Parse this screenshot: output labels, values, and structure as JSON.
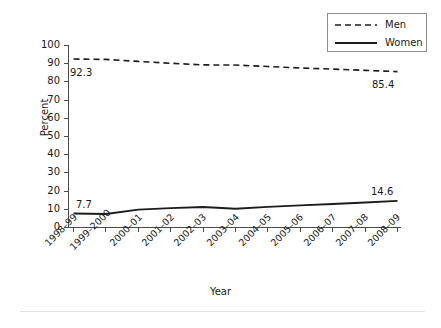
{
  "chart_data": {
    "type": "line",
    "title": "",
    "xlabel": "Year",
    "ylabel": "Percent",
    "ylim": [
      0,
      100
    ],
    "ytick_step": 10,
    "grid": false,
    "legend_position": "top-right",
    "categories": [
      "1998–99",
      "1999–2000",
      "2000–01",
      "2001–02",
      "2002–03",
      "2003–04",
      "2004–05",
      "2005–06",
      "2006–07",
      "2007–08",
      "2008–09"
    ],
    "ytick_labels": [
      "100",
      "90",
      "80",
      "70",
      "60",
      "50",
      "40",
      "30",
      "20",
      "10",
      "0"
    ],
    "series": [
      {
        "name": "Men",
        "style": "dashed",
        "color": "#1c1c1c",
        "values": [
          92.3,
          92.1,
          91.0,
          90.0,
          89.1,
          89.0,
          88.2,
          87.4,
          86.8,
          86.1,
          85.4
        ]
      },
      {
        "name": "Women",
        "style": "solid",
        "color": "#1c1c1c",
        "values": [
          7.7,
          7.4,
          9.8,
          10.6,
          11.2,
          10.3,
          11.3,
          12.1,
          12.9,
          13.7,
          14.6
        ]
      }
    ],
    "annotations": [
      {
        "text": "92.3",
        "series": "Men",
        "category_index": 0,
        "value": 92.3,
        "placement": "below-right"
      },
      {
        "text": "85.4",
        "series": "Men",
        "category_index": 10,
        "value": 85.4,
        "placement": "below-left"
      },
      {
        "text": "7.7",
        "series": "Women",
        "category_index": 0,
        "value": 7.7,
        "placement": "above-right"
      },
      {
        "text": "14.6",
        "series": "Women",
        "category_index": 10,
        "value": 14.6,
        "placement": "above-left"
      }
    ]
  },
  "legend": {
    "men_label": "Men",
    "women_label": "Women"
  },
  "axes": {
    "y_title": "Percent",
    "x_title": "Year"
  }
}
